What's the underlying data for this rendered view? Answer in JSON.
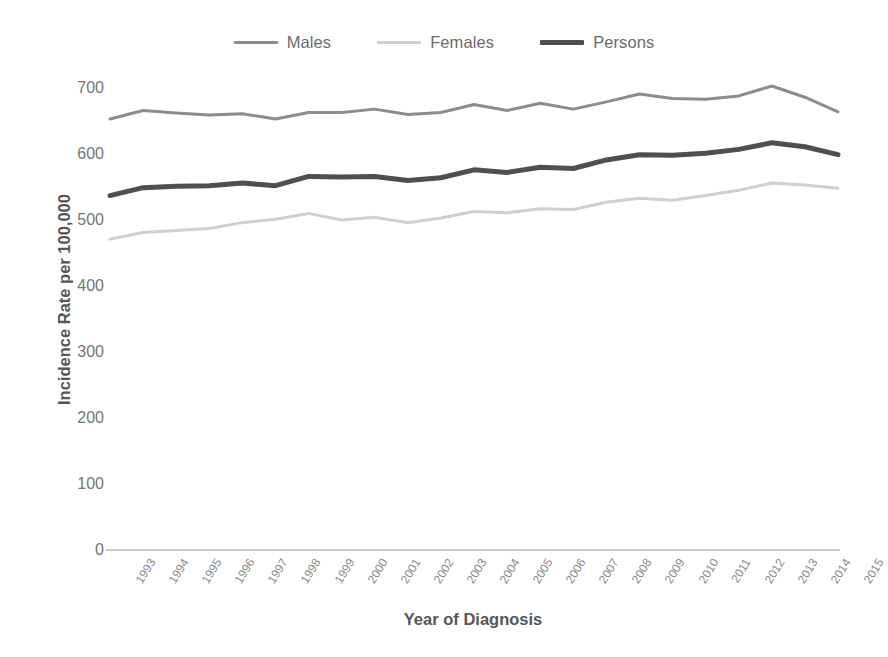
{
  "chart_data": {
    "type": "line",
    "title": "",
    "xlabel": "Year of Diagnosis",
    "ylabel": "Incidence Rate per 100,000",
    "x": [
      1993,
      1994,
      1995,
      1996,
      1997,
      1998,
      1999,
      2000,
      2001,
      2002,
      2003,
      2004,
      2005,
      2006,
      2007,
      2008,
      2009,
      2010,
      2011,
      2012,
      2013,
      2014,
      2015
    ],
    "categories": [
      "1993",
      "1994",
      "1995",
      "1996",
      "1997",
      "1998",
      "1999",
      "2000",
      "2001",
      "2002",
      "2003",
      "2004",
      "2005",
      "2006",
      "2007",
      "2008",
      "2009",
      "2010",
      "2011",
      "2012",
      "2013",
      "2014",
      "2015"
    ],
    "xlim": [
      1993,
      2015
    ],
    "ylim": [
      0,
      700
    ],
    "yticks": [
      0,
      100,
      200,
      300,
      400,
      500,
      600,
      700
    ],
    "ytick_labels": [
      "0",
      "100",
      "200",
      "300",
      "400",
      "500",
      "600",
      "700"
    ],
    "grid": false,
    "legend_position": "top-center",
    "series": [
      {
        "name": "Males",
        "color": "#8c8c8c",
        "width": 3,
        "values": [
          653,
          666,
          662,
          659,
          661,
          653,
          663,
          663,
          668,
          660,
          663,
          675,
          666,
          677,
          668,
          679,
          691,
          684,
          683,
          688,
          703,
          686,
          664
        ]
      },
      {
        "name": "Females",
        "color": "#cfcfcf",
        "width": 3,
        "values": [
          471,
          481,
          484,
          487,
          496,
          501,
          510,
          500,
          504,
          496,
          503,
          513,
          511,
          517,
          516,
          527,
          533,
          530,
          537,
          545,
          556,
          553,
          548
        ]
      },
      {
        "name": "Persons",
        "color": "#4f4f4f",
        "width": 5,
        "values": [
          537,
          549,
          551,
          552,
          556,
          552,
          566,
          565,
          566,
          560,
          564,
          576,
          572,
          580,
          578,
          591,
          599,
          598,
          601,
          607,
          617,
          611,
          599
        ]
      }
    ]
  },
  "legend": {
    "items": [
      {
        "label": "Males",
        "color": "#8c8c8c",
        "thick": false
      },
      {
        "label": "Females",
        "color": "#cfcfcf",
        "thick": false
      },
      {
        "label": "Persons",
        "color": "#4f4f4f",
        "thick": true
      }
    ]
  },
  "axes": {
    "y_title": "Incidence Rate per 100,000",
    "x_title": "Year of Diagnosis",
    "axis_color": "#b5b5b5"
  }
}
